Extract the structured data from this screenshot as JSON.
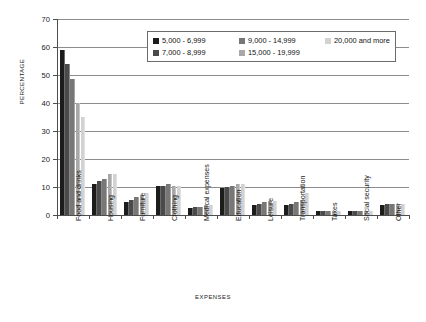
{
  "chart_data": {
    "type": "bar",
    "title": "",
    "subtitle": "",
    "xlabel": "EXPENSES",
    "ylabel": "PERCENTAGE",
    "ylim": [
      0,
      70
    ],
    "yticks": [
      0,
      10,
      20,
      30,
      40,
      50,
      60,
      70
    ],
    "grid": true,
    "legend_position": "top-center",
    "categories": [
      "Food and drinks",
      "Housing",
      "Furniture",
      "Clothing",
      "Medical expenses",
      "Education",
      "Leisure",
      "Transportation",
      "Taxes",
      "Social security",
      "Other"
    ],
    "series": [
      {
        "name": "5,000 - 6,999",
        "color": "#1c1c1c",
        "values": [
          59,
          11,
          4.5,
          10.5,
          2.5,
          9.5,
          3.5,
          3.5,
          1.5,
          1.5,
          3.5
        ]
      },
      {
        "name": "7,000 - 8,999",
        "color": "#4a4a4a",
        "values": [
          54,
          12,
          5.5,
          10.5,
          3,
          10,
          4,
          4,
          1.5,
          1.5,
          4
        ]
      },
      {
        "name": "9,000 - 14,999",
        "color": "#777777",
        "values": [
          48.5,
          13,
          6.5,
          11,
          3,
          10.5,
          4.5,
          4.5,
          1.5,
          1.5,
          4
        ]
      },
      {
        "name": "15,000 - 19,999",
        "color": "#a8a8a8",
        "values": [
          40,
          14.5,
          7,
          10.5,
          3.5,
          11,
          5,
          5.5,
          1.5,
          1.5,
          4
        ]
      },
      {
        "name": "20,000 and more",
        "color": "#d2d2d2",
        "values": [
          35,
          14.5,
          8,
          10.5,
          3.5,
          11,
          5,
          8,
          1.5,
          1.5,
          4
        ]
      }
    ]
  },
  "legend": {
    "rows": [
      [
        {
          "label": "5,000 - 6,999",
          "color": "#1c1c1c"
        },
        {
          "label": "9,000 - 14,999",
          "color": "#777777"
        },
        {
          "label": "20,000 and more",
          "color": "#d2d2d2"
        }
      ],
      [
        {
          "label": "7,000 - 8,999",
          "color": "#4a4a4a"
        },
        {
          "label": "15,000 - 19,999",
          "color": "#a8a8a8"
        }
      ]
    ]
  }
}
